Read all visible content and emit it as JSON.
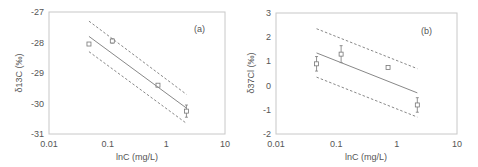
{
  "chart_data": [
    {
      "type": "scatter",
      "panel_label": "(a)",
      "xlabel": "lnC (mg/L)",
      "ylabel": "δ13C (‰)",
      "xscale": "log",
      "xlim": [
        0.01,
        10
      ],
      "ylim": [
        -31,
        -27
      ],
      "xticks": [
        "0.01",
        "0.1",
        "1",
        "10"
      ],
      "yticks": [
        "-27",
        "-28",
        "-29",
        "-30",
        "-31"
      ],
      "grid": false,
      "legend": null,
      "series": [
        {
          "name": "measured",
          "style": "open-square-markers-with-error-bars",
          "points": [
            {
              "x": 0.048,
              "y": -28.05,
              "err": 0.05
            },
            {
              "x": 0.12,
              "y": -27.95,
              "err": 0.07
            },
            {
              "x": 0.72,
              "y": -29.4,
              "err": 0.05
            },
            {
              "x": 2.2,
              "y": -30.25,
              "err": 0.2
            }
          ]
        },
        {
          "name": "regression",
          "style": "solid-line",
          "points": [
            {
              "x": 0.048,
              "y": -27.8
            },
            {
              "x": 2.2,
              "y": -30.15
            }
          ]
        },
        {
          "name": "upper-bound",
          "style": "dashed-line",
          "points": [
            {
              "x": 0.048,
              "y": -27.3
            },
            {
              "x": 2.2,
              "y": -29.7
            }
          ]
        },
        {
          "name": "lower-bound",
          "style": "dashed-line",
          "points": [
            {
              "x": 0.048,
              "y": -28.3
            },
            {
              "x": 2.2,
              "y": -30.65
            }
          ]
        }
      ]
    },
    {
      "type": "scatter",
      "panel_label": "(b)",
      "xlabel": "lnC (mg/L)",
      "ylabel": "δ37Cl (‰)",
      "xscale": "log",
      "xlim": [
        0.01,
        10
      ],
      "ylim": [
        -2,
        3
      ],
      "xticks": [
        "0.01",
        "0.1",
        "1",
        "10"
      ],
      "yticks": [
        "3",
        "2",
        "1",
        "0",
        "-1",
        "-2"
      ],
      "grid": false,
      "legend": null,
      "series": [
        {
          "name": "measured",
          "style": "open-square-markers-with-error-bars",
          "points": [
            {
              "x": 0.047,
              "y": 0.9,
              "err": 0.3
            },
            {
              "x": 0.12,
              "y": 1.3,
              "err": 0.35
            },
            {
              "x": 0.72,
              "y": 0.75,
              "err": 0.05
            },
            {
              "x": 2.2,
              "y": -0.8,
              "err": 0.3
            }
          ]
        },
        {
          "name": "regression",
          "style": "solid-line",
          "points": [
            {
              "x": 0.047,
              "y": 1.35
            },
            {
              "x": 2.2,
              "y": -0.3
            }
          ]
        },
        {
          "name": "upper-bound",
          "style": "dashed-line",
          "points": [
            {
              "x": 0.047,
              "y": 2.35
            },
            {
              "x": 2.2,
              "y": 0.7
            }
          ]
        },
        {
          "name": "lower-bound",
          "style": "dashed-line",
          "points": [
            {
              "x": 0.047,
              "y": 0.35
            },
            {
              "x": 2.2,
              "y": -1.3
            }
          ]
        }
      ]
    }
  ],
  "colors": {
    "frame": "#c8c8c8",
    "line": "#888888",
    "marker": "#777777",
    "text": "#555555"
  }
}
